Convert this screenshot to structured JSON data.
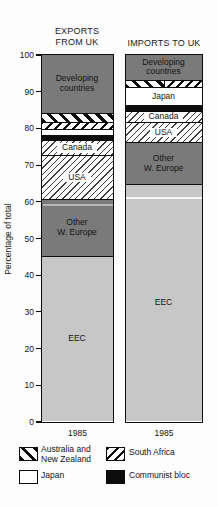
{
  "header": {
    "left_title": "EXPORTS\nFROM UK",
    "right_title": "IMPORTS TO UK"
  },
  "y_axis": {
    "label": "Percentage of total"
  },
  "x_axis": {
    "year_left": "1985",
    "year_right": "1985"
  },
  "chart_data": {
    "type": "bar",
    "variant": "stacked-100-percent",
    "categories": [
      "EXPORTS FROM UK",
      "IMPORTS TO UK"
    ],
    "x_tick_labels": [
      "1985",
      "1985"
    ],
    "ylabel": "Percentage of total",
    "ylim": [
      0,
      100
    ],
    "y_ticks": [
      0,
      10,
      20,
      30,
      40,
      50,
      60,
      70,
      80,
      90,
      100
    ],
    "grid": false,
    "units": "percent of total",
    "series_top_to_bottom": [
      {
        "name": "Developing countries",
        "values": [
          16,
          7
        ],
        "pattern": "darkgray",
        "label": "Developing\ncountries"
      },
      {
        "name": "Australia and New Zealand",
        "values": [
          2.5,
          1
        ],
        "pattern": "ausnz",
        "label": ""
      },
      {
        "name": "South Africa",
        "values": [
          2,
          1
        ],
        "pattern": "sa",
        "label": ""
      },
      {
        "name": "Japan",
        "values": [
          1.5,
          5
        ],
        "pattern": "white",
        "label": "Japan"
      },
      {
        "name": "Communist bloc",
        "values": [
          1.5,
          1.5
        ],
        "pattern": "black",
        "label": ""
      },
      {
        "name": "Canada",
        "values": [
          4,
          3
        ],
        "pattern": "fine",
        "label": "Canada"
      },
      {
        "name": "USA",
        "values": [
          12,
          5.5
        ],
        "pattern": "fine",
        "label": "USA"
      },
      {
        "name": "Other W. Europe",
        "values": [
          15.5,
          11.5
        ],
        "pattern": "darkgray",
        "label": "Other\nW. Europe"
      },
      {
        "name": "EEC",
        "values": [
          45,
          64.5
        ],
        "pattern": "lightgray",
        "label": "EEC"
      }
    ],
    "layout_note": "In the IMPORTS TO UK bar the Australia/New Zealand and South Africa segments are drawn side-by-side within one thin band."
  },
  "legend": {
    "items": [
      {
        "label": "Australia and\nNew Zealand",
        "pattern": "ausnz"
      },
      {
        "label": "South Africa",
        "pattern": "sa"
      },
      {
        "label": "Japan",
        "pattern": "white"
      },
      {
        "label": "Communist bloc",
        "pattern": "black"
      }
    ]
  },
  "colors": {
    "dark_gray": "#7a7a7a",
    "light_gray": "#c7c7c7",
    "black": "#0c0c0c",
    "white": "#ffffff"
  }
}
